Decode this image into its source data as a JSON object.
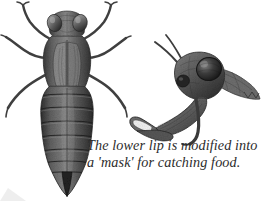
{
  "figure": {
    "background_color": "#ffffff",
    "width": 261,
    "height": 202
  },
  "caption": {
    "line1": "The lower lip is modified into",
    "line2": "a 'mask' for catching food.",
    "color": "#2c2c2c",
    "style": "italic serif"
  },
  "specimens": [
    {
      "id": "nymph-dorsal",
      "label": "Dragonfly nymph, dorsal view",
      "parts": [
        "head",
        "compound-eye-left",
        "compound-eye-right",
        "thorax",
        "wing-pads",
        "abdomen",
        "abdominal-segments",
        "caudal-appendages",
        "legs"
      ],
      "leg_count": 6
    },
    {
      "id": "head-profile-mask",
      "label": "Nymph head in profile with extended labial mask",
      "parts": [
        "head",
        "compound-eye",
        "antennae",
        "labial-mask",
        "labial-palps",
        "thorax-segment"
      ]
    }
  ],
  "palette": {
    "ink_darkest": "#1e1e1e",
    "ink_dark": "#3a3a3a",
    "ink_mid": "#5d5d5d",
    "ink_light": "#7f7f7f",
    "ink_pale": "#a6a6a6",
    "highlight": "#c9c9c9",
    "background": "#ffffff"
  }
}
